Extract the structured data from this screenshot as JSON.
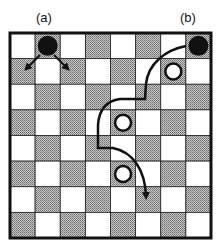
{
  "labels": {
    "a": "(a)",
    "b": "(b)"
  },
  "board": {
    "size": 8,
    "dark_color": "#9a9a9a",
    "light_color": "#ffffff",
    "border_color": "#111111"
  },
  "pieces": [
    {
      "id": "a",
      "color": "black",
      "row": 0,
      "col": 1
    },
    {
      "id": "b",
      "color": "black",
      "row": 0,
      "col": 7
    },
    {
      "id": "w1",
      "color": "white",
      "row": 1,
      "col": 6
    },
    {
      "id": "w2",
      "color": "white",
      "row": 3,
      "col": 4
    },
    {
      "id": "w3",
      "color": "white",
      "row": 5,
      "col": 4
    }
  ],
  "moves": {
    "a": "diagonal forward moves to lower-left and lower-right",
    "b": "multi-jump path over three white pieces"
  }
}
